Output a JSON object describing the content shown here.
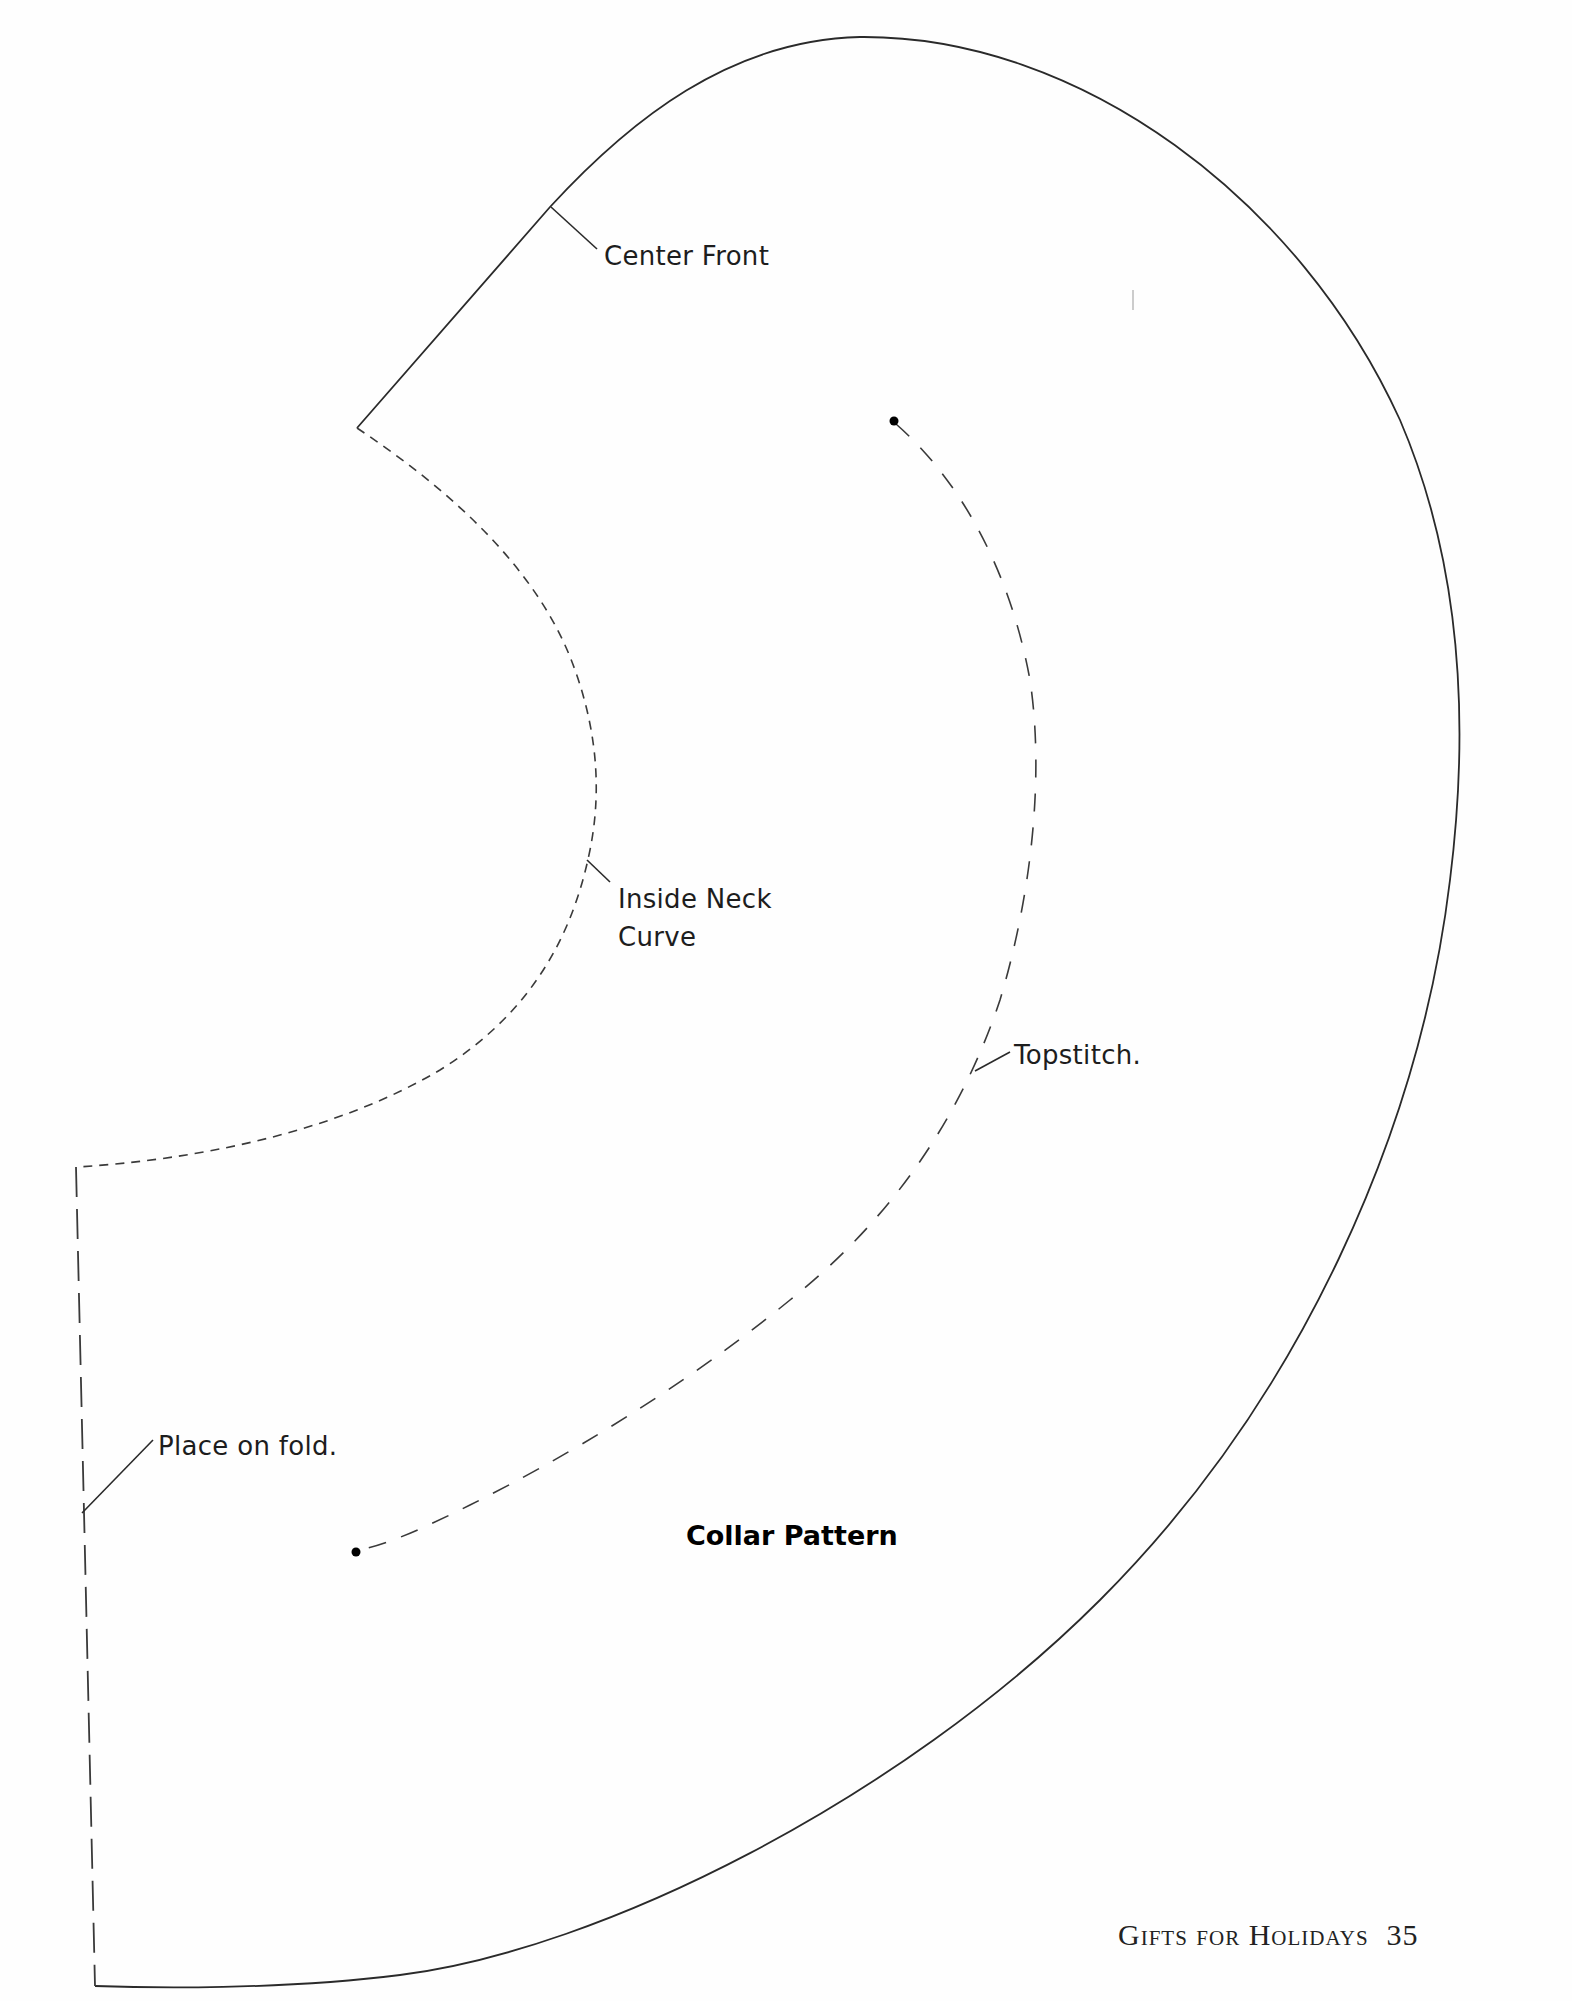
{
  "page": {
    "title": "Collar Pattern",
    "footer": {
      "section": "Gifts for Holidays",
      "page_number": "35"
    }
  },
  "labels": {
    "center_front": "Center Front",
    "inside_neck_line1": "Inside Neck",
    "inside_neck_line2": "Curve",
    "topstitch": "Topstitch.",
    "place_on_fold": "Place on fold."
  },
  "lines": {
    "cutting_line": {
      "style": "solid",
      "color": "#2a2a2a"
    },
    "neck_curve": {
      "style": "short-dash",
      "color": "#3a3a3a"
    },
    "topstitch_line": {
      "style": "long-dash",
      "color": "#3a3a3a"
    },
    "fold_line": {
      "style": "long-dash",
      "color": "#3a3a3a"
    }
  }
}
